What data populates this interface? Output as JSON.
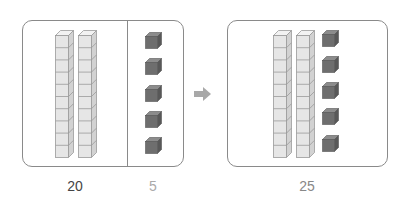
{
  "left_group": {
    "tens_rods": 2,
    "ones_cubes": 5,
    "tens_label": "20",
    "ones_label": "5"
  },
  "arrow": {
    "icon": "right-arrow-icon"
  },
  "right_group": {
    "tens_rods": 2,
    "ones_cubes": 5,
    "total_label": "25"
  },
  "colors": {
    "panel_border": "#8a8a8a",
    "rod_face": "#e6e6e6",
    "rod_side": "#d2d2d2",
    "rod_top": "#f2f2f2",
    "rod_line": "#9a9a9a",
    "cube_face": "#6e6e6e",
    "cube_side": "#585858",
    "cube_top": "#8c8c8c",
    "arrow": "#a8a8a8",
    "label_dark": "#444444",
    "label_light": "#aaaaaa",
    "label_mid": "#888888"
  }
}
